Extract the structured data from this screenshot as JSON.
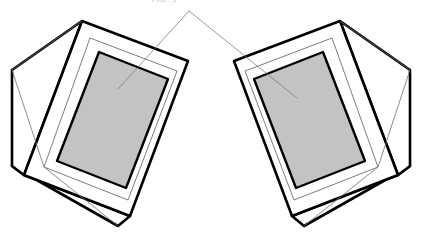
{
  "figure": {
    "title_fragment": "FIG. 1",
    "background_color": "#ffffff",
    "width": 422,
    "height": 236,
    "stroke_color": "#000000",
    "thin_stroke_color": "#6e6e6e",
    "panel_fill": "#c3c3c3",
    "panel_stroke": "#000000",
    "body_fill": "#ffffff"
  },
  "leader": {
    "apex_x": 189,
    "apex_y": 11,
    "left_end_x": 118,
    "left_end_y": 89,
    "right_end_x": 297,
    "right_end_y": 98,
    "color": "#6e6e6e",
    "width": 0.7
  },
  "objects": [
    {
      "name": "left-device",
      "label": "Left enclosure with display panel",
      "orientation": "tilted-left",
      "outer_top_shape": "82,21 188,61 130,216 24,175",
      "side_left_shape": "82,21 24,175 12,166 12,70",
      "side_bottom_shape": "24,175 130,216 118,226 12,166",
      "bezel_shape": "90,38 177,71 128,200 44,167",
      "panel_shape": "99,52 168,79 126,188 57,161",
      "seam_left": "12,70 82,21",
      "seam_inner": "12,70 44,167 118,226"
    },
    {
      "name": "right-device",
      "label": "Right enclosure with display panel",
      "orientation": "tilted-right",
      "outer_top_shape": "340,21 234,61 292,216 398,175",
      "side_right_shape": "340,21 398,175 410,166 410,70",
      "side_bottom_shape": "398,175 292,216 304,226 410,166",
      "bezel_shape": "332,38 245,71 294,200 378,167",
      "panel_shape": "323,52 254,79 296,188 365,161",
      "seam_right": "410,70 340,21",
      "seam_inner": "410,70 378,167 304,226"
    }
  ]
}
